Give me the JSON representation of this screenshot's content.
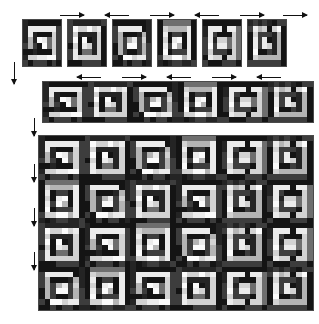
{
  "figure": {
    "background": "#ffffff",
    "border_color": "#4a4a4a",
    "arrow_color": "#111111",
    "palette": {
      "black": "#141414",
      "near_black": "#242424",
      "dark_gray": "#3d3d3d",
      "gray": "#6e6e6e",
      "mid_gray": "#8e8e8e",
      "light_gray": "#b4b4b4",
      "pale_gray": "#d2d2d2",
      "near_white": "#ebebeb",
      "white": "#fbfbfb"
    }
  },
  "rows": [
    {
      "name": "tile-variants-row",
      "label": "row of six base tiles",
      "x": 22,
      "y": 19,
      "tile_w": 40,
      "tile_h": 48,
      "gap": 5,
      "count": 6,
      "arrows": [
        {
          "dir": "right",
          "x": 60,
          "y": 12,
          "len": 24
        },
        {
          "dir": "left",
          "x": 105,
          "y": 12,
          "len": 24
        },
        {
          "dir": "right",
          "x": 150,
          "y": 12,
          "len": 24
        },
        {
          "dir": "left",
          "x": 195,
          "y": 12,
          "len": 24
        },
        {
          "dir": "right",
          "x": 240,
          "y": 12,
          "len": 24
        },
        {
          "dir": "right",
          "x": 283,
          "y": 12,
          "len": 24
        }
      ]
    },
    {
      "name": "strip-row",
      "label": "assembled horizontal strip",
      "x": 42,
      "y": 81,
      "w": 272,
      "h": 42,
      "arrows": [
        {
          "dir": "left",
          "x": 77,
          "y": 74,
          "len": 24
        },
        {
          "dir": "right",
          "x": 122,
          "y": 74,
          "len": 24
        },
        {
          "dir": "left",
          "x": 167,
          "y": 74,
          "len": 24
        },
        {
          "dir": "right",
          "x": 212,
          "y": 74,
          "len": 24
        },
        {
          "dir": "left",
          "x": 257,
          "y": 74,
          "len": 24
        }
      ]
    },
    {
      "name": "full-pattern-grid",
      "label": "full repeating quilt pattern",
      "x": 38,
      "y": 135,
      "w": 276,
      "h": 176
    }
  ],
  "left_arrows": [
    {
      "name": "left-arrow-top",
      "dir": "down",
      "x": 11,
      "y": 62,
      "len": 22
    },
    {
      "name": "left-arrow-strip",
      "dir": "down",
      "x": 31,
      "y": 118,
      "len": 18
    },
    {
      "name": "left-arrow-grid-1",
      "dir": "down",
      "x": 31,
      "y": 164,
      "len": 18
    },
    {
      "name": "left-arrow-grid-2",
      "dir": "down",
      "x": 31,
      "y": 208,
      "len": 18
    },
    {
      "name": "left-arrow-grid-3",
      "dir": "down",
      "x": 31,
      "y": 252,
      "len": 18
    }
  ],
  "chart_data": {
    "type": "heatmap",
    "xlabel": "",
    "ylabel": "",
    "grid": false,
    "legend": "none",
    "tile_cells": 8,
    "tile_variants": 6,
    "strip_tiles": 6,
    "grid_tiles_x": 6,
    "grid_tiles_y": 4,
    "value_levels": [
      0.08,
      0.14,
      0.24,
      0.43,
      0.56,
      0.71,
      0.82,
      0.92,
      0.98
    ],
    "tiles": [
      {
        "id": 1,
        "rot": 0,
        "mirror": false,
        "seed": 11
      },
      {
        "id": 2,
        "rot": 90,
        "mirror": false,
        "seed": 23
      },
      {
        "id": 3,
        "rot": 0,
        "mirror": true,
        "seed": 31
      },
      {
        "id": 4,
        "rot": 90,
        "mirror": true,
        "seed": 47
      },
      {
        "id": 5,
        "rot": 0,
        "mirror": false,
        "seed": 59
      },
      {
        "id": 6,
        "rot": 90,
        "mirror": false,
        "seed": 67
      }
    ],
    "strip_sequence": [
      1,
      2,
      3,
      4,
      5,
      6
    ],
    "grid_sequence": [
      [
        1,
        2,
        3,
        4,
        5,
        6
      ],
      [
        4,
        3,
        2,
        1,
        6,
        5
      ],
      [
        2,
        1,
        4,
        3,
        6,
        5
      ],
      [
        3,
        4,
        1,
        2,
        5,
        6
      ]
    ]
  }
}
